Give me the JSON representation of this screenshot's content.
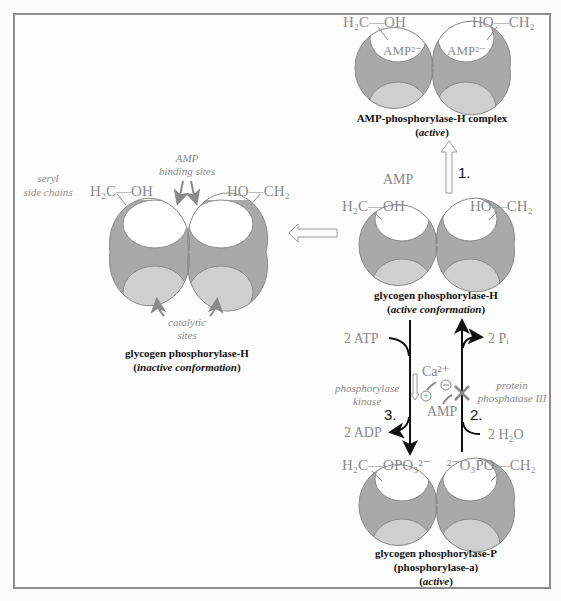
{
  "colors": {
    "enzyme_body": "#a9a9a9",
    "enzyme_outline": "#8a8a8a",
    "upper_pocket": "#ffffff",
    "lower_pocket": "#cfcfcf",
    "label_grey": "#8a8a8a",
    "arrow_dark": "#111111",
    "frame": "#8c8c8c"
  },
  "amp_complex": {
    "left_group": "H₂C—OH",
    "right_group": "HO—CH₂",
    "left_pocket_label": "AMP²⁻",
    "right_pocket_label": "AMP²⁻",
    "title": "AMP-phosphorylase-H complex",
    "state": "active"
  },
  "step1": {
    "number": "1.",
    "reactant": "AMP"
  },
  "active_conformation": {
    "left_group": "H₂C—OH",
    "right_group": "HO—CH₂",
    "title": "glycogen phosphorylase-H",
    "state": "active conformation"
  },
  "inactive_conformation": {
    "side_label_line1": "seryl",
    "side_label_line2": "side chains",
    "top_label_line1": "AMP",
    "top_label_line2": "binding sites",
    "bottom_label_line1": "catalytic",
    "bottom_label_line2": "sites",
    "left_group": "H₂C—OH",
    "right_group": "HO—CH₂",
    "title": "glycogen phosphorylase-H",
    "state": "inactive conformation"
  },
  "step3": {
    "number": "3.",
    "input": "2 ATP",
    "output": "2 ADP",
    "enzyme_line1": "phosphorylase",
    "enzyme_line2": "kinase",
    "activator": "Ca²⁺",
    "activator_sign": "+"
  },
  "step2": {
    "number": "2.",
    "input": "2 H₂O",
    "output": "2 Pᵢ",
    "enzyme_line1": "protein",
    "enzyme_line2": "phosphatase III",
    "inhibitor": "AMP",
    "inhibitor_sign": "−"
  },
  "phosphorylated": {
    "left_group": "H₂C—OPO₃²⁻",
    "right_group": "²⁻O₃PO—CH₂",
    "title": "glycogen phosphorylase-P",
    "subtitle": "(phosphorylase-a)",
    "state": "active"
  }
}
